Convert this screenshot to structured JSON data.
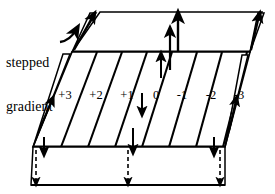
{
  "figure": {
    "type": "diagram",
    "annotation": {
      "label_line1": "stepped",
      "label_line2": "gradient",
      "pointer": "curved-arrow-icon"
    },
    "tick_labels": [
      "+3",
      "+2",
      "+1",
      "0",
      "-1",
      "-2",
      "-3"
    ],
    "bands": {
      "top": {
        "arrow_direction": "up",
        "line_style": "solid"
      },
      "middle": {
        "stripes": 7
      },
      "bottom": {
        "arrow_direction": "down",
        "line_style": "dashed"
      }
    },
    "colors": {
      "ink": "#000000",
      "paper": "#ffffff"
    }
  }
}
